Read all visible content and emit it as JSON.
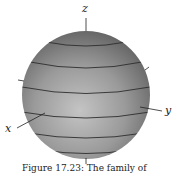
{
  "figure": {
    "type": "3d-surface-plot",
    "surface": "sphere",
    "axes": {
      "x_label": "x",
      "y_label": "y",
      "z_label": "z"
    },
    "latitude_lines": 6,
    "colors": {
      "sphere_fill": "#9a9a9a",
      "sphere_highlight": "#c8c8c8",
      "sphere_shadow": "#5e5e5e",
      "contour_line": "#2e2e2e",
      "axis_line": "#222222"
    }
  },
  "caption": "Figure 17.23: The family of"
}
